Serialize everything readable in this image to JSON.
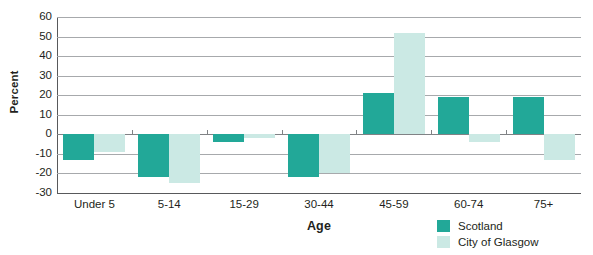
{
  "chart_data": {
    "type": "bar",
    "title": "",
    "xlabel": "Age",
    "ylabel": "Percent",
    "categories": [
      "Under 5",
      "5-14",
      "15-29",
      "30-44",
      "45-59",
      "60-74",
      "75+"
    ],
    "series": [
      {
        "name": "Scotland",
        "color": "#22a898",
        "values": [
          -13,
          -22,
          -4,
          -22,
          21,
          19,
          19
        ]
      },
      {
        "name": "City of Glasgow",
        "color": "#cbe9e4",
        "values": [
          -9,
          -25,
          -2,
          -20,
          52,
          -4,
          -13
        ]
      }
    ],
    "ylim": [
      -30,
      60
    ],
    "yticks": [
      60,
      50,
      40,
      30,
      20,
      10,
      0,
      -10,
      -20,
      -30
    ],
    "ytick_labels": [
      "60",
      "50",
      "40",
      "30",
      "20",
      "10",
      "0",
      "-10",
      "-20",
      "-30"
    ],
    "grid": true,
    "legend_position": "bottom-right"
  },
  "legend": {
    "entries": [
      {
        "label": "Scotland",
        "color": "#22a898"
      },
      {
        "label": "City of Glasgow",
        "color": "#cbe9e4"
      }
    ]
  },
  "colors": {
    "scotland": "#22a898",
    "glasgow": "#cbe9e4",
    "gridline": "#a7a9ac",
    "axis": "#58595b",
    "text": "#231f20"
  }
}
